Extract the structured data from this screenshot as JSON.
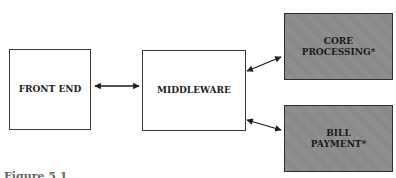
{
  "diagram": {
    "nodes": [
      {
        "id": "front_end",
        "label": "FRONT END",
        "style": "plain"
      },
      {
        "id": "middleware",
        "label": "MIDDLEWARE",
        "style": "plain"
      },
      {
        "id": "core_processing",
        "label_line1": "CORE",
        "label_line2": "PROCESSING*",
        "style": "shaded"
      },
      {
        "id": "bill_payment",
        "label_line1": "BILL",
        "label_line2": "PAYMENT*",
        "style": "shaded"
      }
    ],
    "edges": [
      {
        "from": "front_end",
        "to": "middleware",
        "direction": "bidirectional"
      },
      {
        "from": "middleware",
        "to": "core_processing",
        "direction": "bidirectional"
      },
      {
        "from": "middleware",
        "to": "bill_payment",
        "direction": "bidirectional"
      }
    ],
    "caption": "Figure 5.1  ...",
    "colors": {
      "shaded_fill": "#8c8c8c",
      "border": "#2e2e2e",
      "arrow": "#1e1e1e"
    }
  }
}
